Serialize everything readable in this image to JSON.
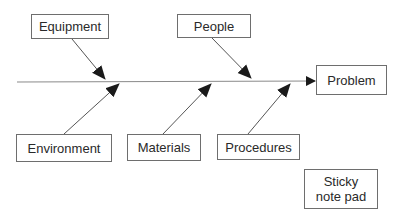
{
  "diagram": {
    "type": "fishbone",
    "effect": {
      "label": "Problem"
    },
    "causes": [
      {
        "label": "Equipment",
        "side": "top"
      },
      {
        "label": "People",
        "side": "top"
      },
      {
        "label": "Environment",
        "side": "bottom"
      },
      {
        "label": "Materials",
        "side": "bottom"
      },
      {
        "label": "Procedures",
        "side": "bottom"
      }
    ],
    "note": {
      "line1": "Sticky",
      "line2": "note pad"
    }
  },
  "colors": {
    "line": "#7a7a7a",
    "arrow": "#1a1a1a",
    "border": "#6e6e6e",
    "text": "#2a2a2a"
  }
}
